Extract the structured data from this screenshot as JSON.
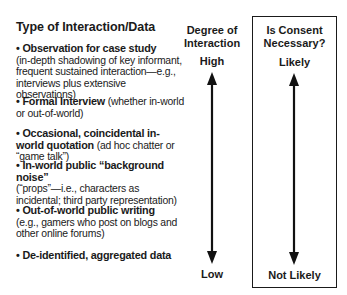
{
  "left_column": {
    "title": "Type of Interaction/Data",
    "items": [
      {
        "bold": "• Observation for case study",
        "detail": "(in-depth shadowing of key informant, frequent sustained interaction—e.g., interviews plus extensive observations)"
      },
      {
        "bold": "• Formal Interview",
        "detail": " (whether in-world or out-of-world)"
      },
      {
        "bold": "• Occasional, coincidental in-world quotation",
        "detail": " (ad hoc chatter or “game talk”)"
      },
      {
        "bold": "• In-world public “background noise”",
        "detail": "(“props”—i.e., characters as incidental; third party representation)"
      },
      {
        "bold": "• Out-of-world public writing",
        "detail": "(e.g., gamers who post on blogs and other online forums)"
      },
      {
        "bold": "• De-identified, aggregated data",
        "detail": ""
      }
    ]
  },
  "middle_column": {
    "heading_line1": "Degree of",
    "heading_line2": "Interaction",
    "top_label": "High",
    "bottom_label": "Low",
    "arrow": "double-headed-vertical"
  },
  "right_column": {
    "heading_line1": "Is Consent",
    "heading_line2": "Necessary?",
    "top_label": "Likely",
    "bottom_label": "Not Likely",
    "arrow": "double-headed-vertical",
    "boxed": true
  }
}
